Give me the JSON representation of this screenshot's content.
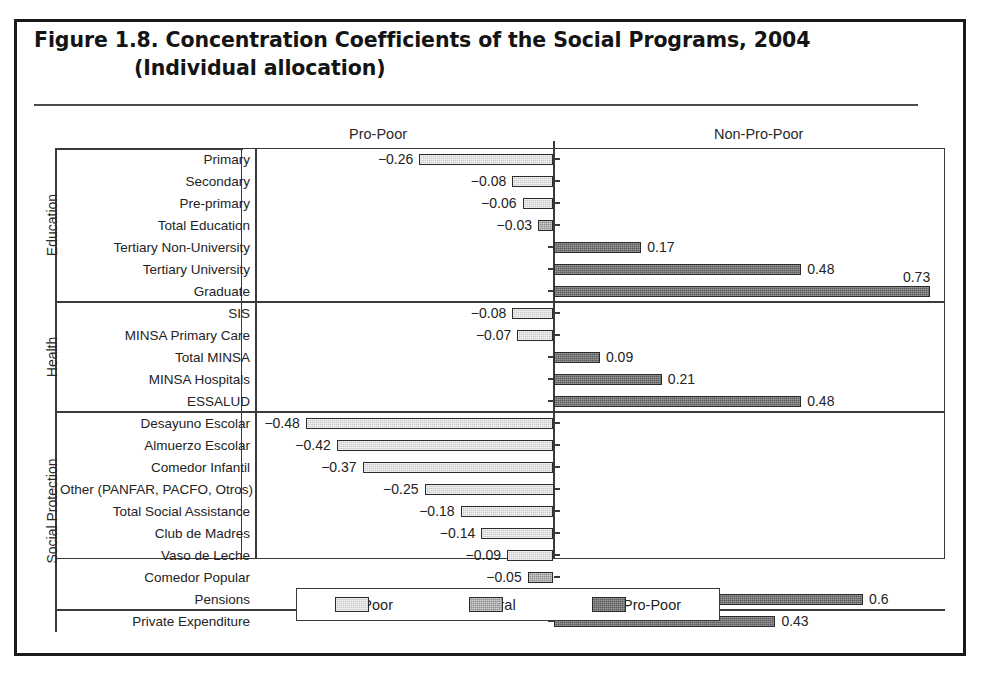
{
  "figure": {
    "title_line_1": "Figure 1.8.  Concentration Coefficients of the Social Programs, 2004",
    "title_line_2": "(Individual allocation)"
  },
  "headers": {
    "left": "Pro-Poor",
    "right": "Non-Pro-Poor"
  },
  "groups": [
    {
      "label": "Education"
    },
    {
      "label": "Health"
    },
    {
      "label": "Social Protection"
    }
  ],
  "legend": {
    "items": [
      {
        "label": "Pro-Poor",
        "color": "#c9c9c9"
      },
      {
        "label": "Neutral",
        "color": "#8f8f8f"
      },
      {
        "label": "Non-Pro-Poor",
        "color": "#5c5c5c"
      }
    ]
  },
  "chart_data": {
    "type": "bar",
    "orientation": "horizontal",
    "title": "Figure 1.8.  Concentration Coefficients of the Social Programs, 2004 (Individual allocation)",
    "xlabel": "",
    "ylabel": "",
    "xlim": [
      -0.55,
      0.82
    ],
    "grid": false,
    "legend_position": "bottom",
    "zero_axis": 0,
    "axis_headers": {
      "negative_side": "Pro-Poor",
      "positive_side": "Non-Pro-Poor"
    },
    "categories": [
      "Primary",
      "Secondary",
      "Pre-primary",
      "Total Education",
      "Tertiary Non-University",
      "Tertiary University",
      "Graduate",
      "SIS",
      "MINSA Primary Care",
      "Total MINSA",
      "MINSA Hospitals",
      "ESSALUD",
      "Desayuno Escolar",
      "Almuerzo Escolar",
      "Comedor Infantil",
      "Other (PANFAR, PACFO, Otros)",
      "Total Social Assistance",
      "Club de Madres",
      "Vaso de Leche",
      "Comedor Popular",
      "Pensions",
      "Private Expenditure"
    ],
    "values": [
      -0.26,
      -0.08,
      -0.06,
      -0.03,
      0.17,
      0.48,
      0.73,
      -0.08,
      -0.07,
      0.09,
      0.21,
      0.48,
      -0.48,
      -0.42,
      -0.37,
      -0.25,
      -0.18,
      -0.14,
      -0.09,
      -0.05,
      0.6,
      0.43
    ],
    "value_labels": [
      "−0.26",
      "−0.08",
      "−0.06",
      "−0.03",
      "0.17",
      "0.48",
      "0.73",
      "−0.08",
      "−0.07",
      "0.09",
      "0.21",
      "0.48",
      "−0.48",
      "−0.42",
      "−0.37",
      "−0.25",
      "−0.18",
      "−0.14",
      "−0.09",
      "−0.05",
      "0.6",
      "0.43"
    ],
    "series_class": [
      "pro-poor",
      "pro-poor",
      "pro-poor",
      "neutral",
      "non-pro-poor",
      "non-pro-poor",
      "non-pro-poor",
      "pro-poor",
      "pro-poor",
      "non-pro-poor",
      "non-pro-poor",
      "non-pro-poor",
      "pro-poor",
      "pro-poor",
      "pro-poor",
      "pro-poor",
      "pro-poor",
      "pro-poor",
      "pro-poor",
      "neutral",
      "non-pro-poor",
      "non-pro-poor"
    ],
    "group_membership": [
      "Education",
      "Education",
      "Education",
      "Education",
      "Education",
      "Education",
      "Education",
      "Health",
      "Health",
      "Health",
      "Health",
      "Health",
      "Social Protection",
      "Social Protection",
      "Social Protection",
      "Social Protection",
      "Social Protection",
      "Social Protection",
      "Social Protection",
      "Social Protection",
      "Social Protection",
      ""
    ]
  }
}
